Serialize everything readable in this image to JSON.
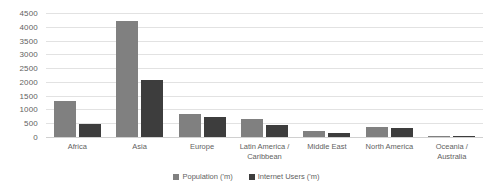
{
  "chart_data": {
    "type": "bar",
    "title": "",
    "subtitle": "",
    "xlabel": "",
    "ylabel": "",
    "ylim": [
      0,
      4500
    ],
    "yticks": [
      0,
      500,
      1000,
      1500,
      2000,
      2500,
      3000,
      3500,
      4000,
      4500
    ],
    "grid": true,
    "legend_position": "bottom",
    "categories": [
      "Africa",
      "Asia",
      "Europe",
      "Latin America / Caribbean",
      "Middle East",
      "North America",
      "Oceania / Australia"
    ],
    "series": [
      {
        "name": "Population ('m)",
        "color": "#808080",
        "values": [
          1300,
          4200,
          830,
          650,
          230,
          360,
          40
        ]
      },
      {
        "name": "Internet Users ('m)",
        "color": "#3d3d3d",
        "values": [
          460,
          2060,
          710,
          440,
          130,
          320,
          28
        ]
      }
    ]
  }
}
